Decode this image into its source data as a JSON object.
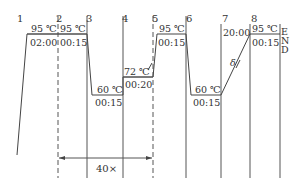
{
  "diagram": {
    "type": "PCR thermal cycling profile",
    "step_numbers": [
      "1",
      "2",
      "3",
      "4",
      "5",
      "6",
      "7",
      "8"
    ],
    "end_label": [
      "E",
      "N",
      "D"
    ],
    "steps": [
      {
        "id": "1",
        "temp": "95 ℃",
        "time": "02:00"
      },
      {
        "id": "2",
        "temp": "95 ℃",
        "time": "00:15"
      },
      {
        "id": "3",
        "temp": "60 ℃",
        "time": "00:15"
      },
      {
        "id": "4",
        "temp": "72 ℃",
        "time": "00:20"
      },
      {
        "id": "5",
        "temp": "95 ℃",
        "time": "00:15"
      },
      {
        "id": "6",
        "temp": "60 ℃",
        "time": "00:15"
      },
      {
        "id": "7",
        "time": "20:00",
        "ramp_label": "δ"
      },
      {
        "id": "8",
        "temp": "95 ℃",
        "time": "00:15"
      }
    ],
    "cycle_label": "40×"
  }
}
